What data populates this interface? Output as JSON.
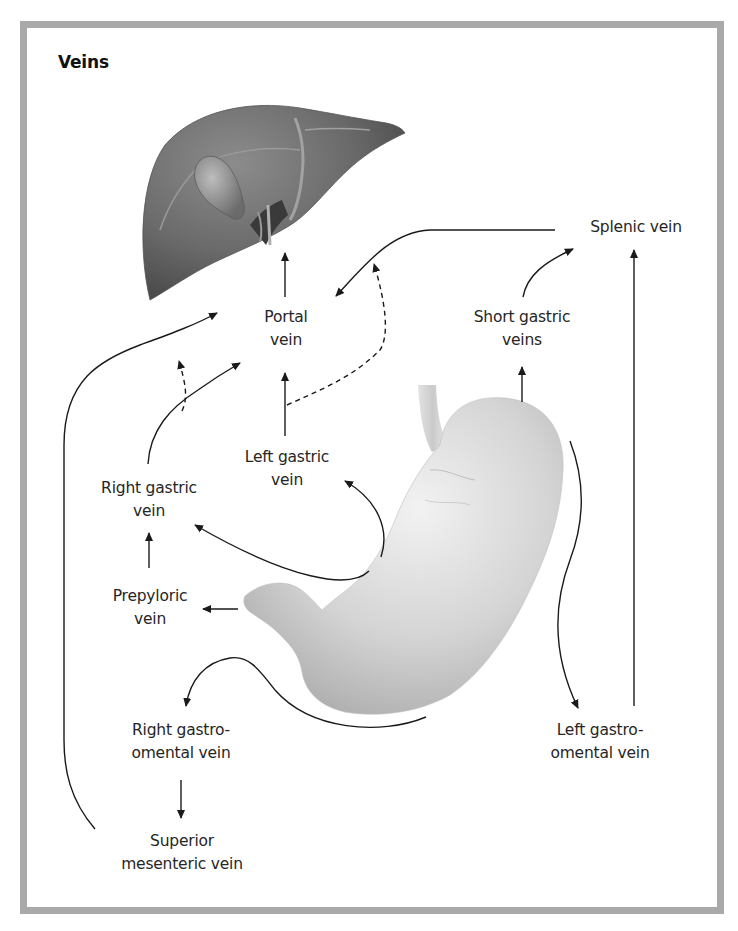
{
  "figure": {
    "title": "Veins",
    "colors": {
      "frame_border": "#a9a9a9",
      "background": "#ffffff",
      "arrow": "#1a1a1a",
      "liver": "#6e6e6e",
      "stomach": "#cfcfcf"
    },
    "organs": [
      {
        "name": "liver",
        "label": ""
      },
      {
        "name": "stomach",
        "label": ""
      }
    ],
    "labels": {
      "portal_vein": [
        "Portal",
        "vein"
      ],
      "splenic_vein": [
        "Splenic vein"
      ],
      "short_gastric_veins": [
        "Short gastric",
        "veins"
      ],
      "left_gastric_vein": [
        "Left gastric",
        "vein"
      ],
      "right_gastric_vein": [
        "Right gastric",
        "vein"
      ],
      "prepyloric_vein": [
        "Prepyloric",
        "vein"
      ],
      "right_gastro_omental_vein": [
        "Right gastro-",
        "omental vein"
      ],
      "left_gastro_omental_vein": [
        "Left gastro-",
        "omental vein"
      ],
      "superior_mesenteric_vein": [
        "Superior",
        "mesenteric vein"
      ]
    },
    "flows": [
      {
        "from": "Portal vein",
        "to": "Liver",
        "style": "solid"
      },
      {
        "from": "Splenic vein",
        "to": "Portal vein",
        "style": "solid"
      },
      {
        "from": "Left gastric vein",
        "to": "Splenic vein (variant)",
        "style": "dashed"
      },
      {
        "from": "Short gastric veins",
        "to": "Splenic vein",
        "style": "solid"
      },
      {
        "from": "Stomach (fundus)",
        "to": "Short gastric veins",
        "style": "solid"
      },
      {
        "from": "Left gastro-omental vein",
        "to": "Splenic vein",
        "style": "solid"
      },
      {
        "from": "Stomach (greater curvature)",
        "to": "Left gastro-omental vein",
        "style": "solid"
      },
      {
        "from": "Left gastric vein",
        "to": "Portal vein",
        "style": "solid"
      },
      {
        "from": "Stomach (lesser curvature)",
        "to": "Left gastric vein",
        "style": "solid"
      },
      {
        "from": "Stomach (lesser curvature)",
        "to": "Right gastric vein",
        "style": "solid"
      },
      {
        "from": "Right gastric vein",
        "to": "Portal vein",
        "style": "solid"
      },
      {
        "from": "Right gastric vein",
        "to": "Superior mesenteric vein (variant)",
        "style": "dashed"
      },
      {
        "from": "Prepyloric vein",
        "to": "Right gastric vein",
        "style": "solid"
      },
      {
        "from": "Pylorus",
        "to": "Prepyloric vein",
        "style": "solid"
      },
      {
        "from": "Stomach (greater curvature)",
        "to": "Right gastro-omental vein",
        "style": "solid"
      },
      {
        "from": "Right gastro-omental vein",
        "to": "Superior mesenteric vein",
        "style": "solid"
      },
      {
        "from": "Superior mesenteric vein",
        "to": "Portal vein",
        "style": "solid"
      }
    ]
  }
}
